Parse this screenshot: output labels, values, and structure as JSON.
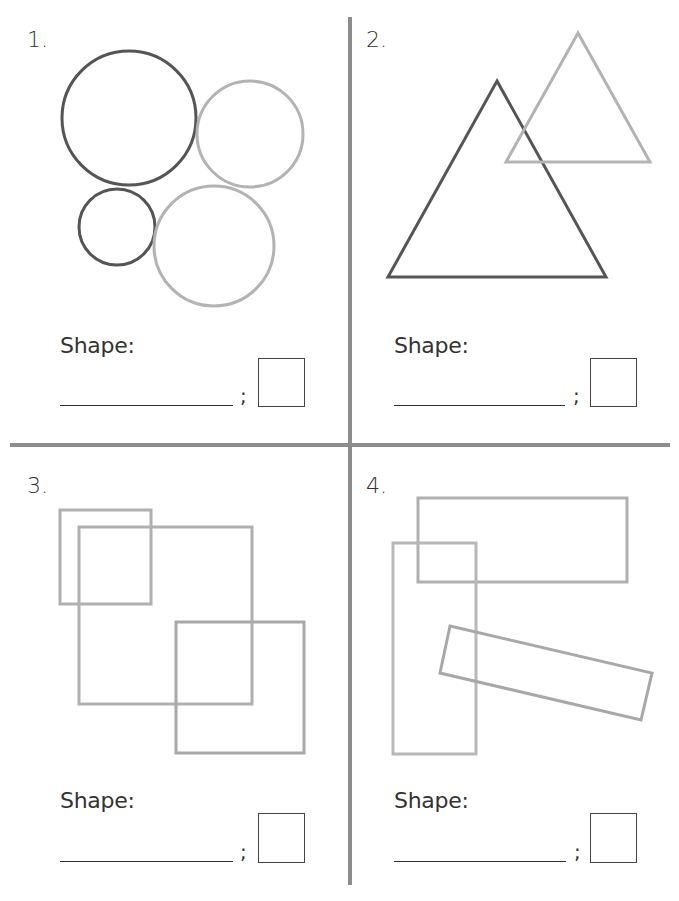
{
  "worksheet": {
    "panels": [
      {
        "number": "1.",
        "figure": "four-circles",
        "shape_label": "Shape:",
        "separator": ";",
        "answer_line": "",
        "count_box": "",
        "shapes": {
          "circles": [
            {
              "cx": 129,
              "cy": 118,
              "r": 67,
              "stroke": "#555555"
            },
            {
              "cx": 250,
              "cy": 134,
              "r": 53,
              "stroke": "#b3b3b3"
            },
            {
              "cx": 117,
              "cy": 227,
              "r": 38,
              "stroke": "#555555"
            },
            {
              "cx": 214,
              "cy": 246,
              "r": 60,
              "stroke": "#b3b3b3"
            }
          ]
        }
      },
      {
        "number": "2.",
        "figure": "two-triangles",
        "shape_label": "Shape:",
        "separator": ";",
        "answer_line": "",
        "count_box": "",
        "shapes": {
          "triangles": [
            {
              "points": "497,81 606,277 388,277",
              "stroke": "#555555"
            },
            {
              "points": "578,33 650,162 506,162",
              "stroke": "#b3b3b3"
            }
          ]
        }
      },
      {
        "number": "3.",
        "figure": "three-squares",
        "shape_label": "Shape:",
        "separator": ";",
        "answer_line": "",
        "count_box": "",
        "shapes": {
          "squares": [
            {
              "x": 60,
              "y": 510,
              "w": 91,
              "h": 94,
              "stroke": "#b0b0b0"
            },
            {
              "x": 79,
              "y": 527,
              "w": 173,
              "h": 177,
              "stroke": "#b0b0b0"
            },
            {
              "x": 176,
              "y": 622,
              "w": 128,
              "h": 131,
              "stroke": "#a8a8a8"
            }
          ]
        }
      },
      {
        "number": "4.",
        "figure": "three-rectangles",
        "shape_label": "Shape:",
        "separator": ";",
        "answer_line": "",
        "count_box": "",
        "shapes": {
          "rectangles": [
            {
              "points": "418,498 627,498 627,582 418,582",
              "stroke": "#b0b0b0"
            },
            {
              "points": "393,543 476,543 476,754 393,754",
              "stroke": "#b8b8b8"
            },
            {
              "points": "450,626 652,673 641,720 440,673",
              "stroke": "#a8a8a8"
            }
          ]
        }
      }
    ]
  },
  "colors": {
    "dark_stroke": "#555555",
    "light_stroke": "#b3b3b3",
    "divider": "#8c8c8c",
    "text": "#333333"
  }
}
